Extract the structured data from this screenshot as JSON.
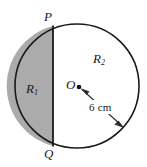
{
  "figure": {
    "background_color": "#ffffff",
    "stroke_color": "#1a1a1a",
    "shaded_fill_color": "#ababab",
    "unshaded_fill_color": "#ffffff",
    "labels": {
      "point_p": "P",
      "point_q": "Q",
      "center_o": "O",
      "region_shaded_base": "R",
      "region_shaded_sub": "1",
      "region_unshaded_base": "R",
      "region_unshaded_sub": "2",
      "radius_measure": "6 cm"
    },
    "geometry": {
      "circle_center_x": 77,
      "circle_center_y": 86,
      "circle_radius": 62,
      "chord_x": 53,
      "chord_top_y": 26,
      "chord_bottom_y": 146,
      "center_dot_x": 79,
      "center_dot_y": 87,
      "arrow_tip_x": 124,
      "arrow_tip_y": 128
    }
  }
}
